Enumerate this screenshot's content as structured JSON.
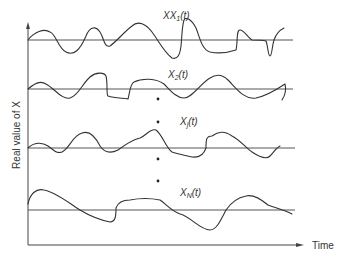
{
  "diagram": {
    "title": "",
    "y_axis_label": "Real value of X",
    "x_axis_label": "Time",
    "signals": [
      {
        "name": "X1",
        "sub": "1",
        "label_suffix": "(t)"
      },
      {
        "name": "X2",
        "sub": "2",
        "label_suffix": "(t)"
      },
      {
        "name": "Xj",
        "sub": "j",
        "label_suffix": "(t)"
      },
      {
        "name": "XN",
        "sub": "N",
        "label_suffix": "(t)"
      }
    ],
    "ellipsis_dots": 4,
    "colors": {
      "line": "#333333",
      "baseline": "#555555",
      "background": "#ffffff"
    }
  }
}
